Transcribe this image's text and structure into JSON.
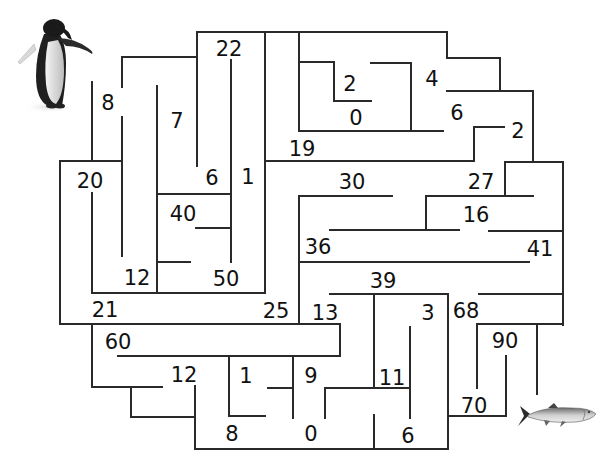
{
  "puzzle": {
    "type": "number-maze",
    "start": {
      "label": "penguin",
      "x": 55,
      "y": 65
    },
    "finish": {
      "label": "salmon fish",
      "x": 555,
      "y": 415
    },
    "numbers": [
      {
        "value": "22",
        "x": 229,
        "y": 49
      },
      {
        "value": "8",
        "x": 108,
        "y": 103
      },
      {
        "value": "7",
        "x": 177,
        "y": 121
      },
      {
        "value": "2",
        "x": 350,
        "y": 84
      },
      {
        "value": "4",
        "x": 432,
        "y": 79
      },
      {
        "value": "0",
        "x": 356,
        "y": 118
      },
      {
        "value": "6",
        "x": 457,
        "y": 113
      },
      {
        "value": "2",
        "x": 518,
        "y": 131
      },
      {
        "value": "19",
        "x": 302,
        "y": 149
      },
      {
        "value": "20",
        "x": 90,
        "y": 181
      },
      {
        "value": "6",
        "x": 212,
        "y": 178
      },
      {
        "value": "1",
        "x": 248,
        "y": 177
      },
      {
        "value": "30",
        "x": 352,
        "y": 182
      },
      {
        "value": "27",
        "x": 481,
        "y": 182
      },
      {
        "value": "40",
        "x": 183,
        "y": 214
      },
      {
        "value": "16",
        "x": 476,
        "y": 215
      },
      {
        "value": "36",
        "x": 318,
        "y": 247
      },
      {
        "value": "41",
        "x": 540,
        "y": 249
      },
      {
        "value": "12",
        "x": 137,
        "y": 278
      },
      {
        "value": "50",
        "x": 226,
        "y": 279
      },
      {
        "value": "39",
        "x": 383,
        "y": 281
      },
      {
        "value": "21",
        "x": 105,
        "y": 310
      },
      {
        "value": "25",
        "x": 276,
        "y": 311
      },
      {
        "value": "13",
        "x": 325,
        "y": 313
      },
      {
        "value": "3",
        "x": 428,
        "y": 313
      },
      {
        "value": "68",
        "x": 466,
        "y": 311
      },
      {
        "value": "60",
        "x": 118,
        "y": 342
      },
      {
        "value": "90",
        "x": 505,
        "y": 341
      },
      {
        "value": "12",
        "x": 184,
        "y": 375
      },
      {
        "value": "1",
        "x": 246,
        "y": 376
      },
      {
        "value": "9",
        "x": 311,
        "y": 376
      },
      {
        "value": "11",
        "x": 392,
        "y": 378
      },
      {
        "value": "70",
        "x": 474,
        "y": 406
      },
      {
        "value": "8",
        "x": 232,
        "y": 434
      },
      {
        "value": "0",
        "x": 311,
        "y": 434
      },
      {
        "value": "6",
        "x": 408,
        "y": 436
      }
    ],
    "walls": [
      [
        197,
        32,
        447,
        32
      ],
      [
        197,
        32,
        197,
        166
      ],
      [
        122,
        57,
        197,
        57
      ],
      [
        122,
        57,
        122,
        87
      ],
      [
        122,
        117,
        122,
        256
      ],
      [
        92,
        82,
        92,
        161
      ],
      [
        157,
        86,
        157,
        292
      ],
      [
        265,
        32,
        265,
        293
      ],
      [
        231,
        60,
        231,
        262
      ],
      [
        299,
        32,
        299,
        131
      ],
      [
        299,
        62,
        334,
        62
      ],
      [
        334,
        62,
        334,
        101
      ],
      [
        334,
        101,
        371,
        101
      ],
      [
        371,
        63,
        411,
        63
      ],
      [
        411,
        63,
        411,
        131
      ],
      [
        299,
        131,
        443,
        131
      ],
      [
        447,
        32,
        447,
        58
      ],
      [
        447,
        58,
        500,
        58
      ],
      [
        500,
        58,
        500,
        91
      ],
      [
        447,
        91,
        533,
        91
      ],
      [
        533,
        91,
        533,
        162
      ],
      [
        474,
        127,
        504,
        127
      ],
      [
        474,
        127,
        474,
        161
      ],
      [
        265,
        161,
        474,
        161
      ],
      [
        505,
        162,
        563,
        162
      ],
      [
        505,
        162,
        505,
        196
      ],
      [
        563,
        162,
        563,
        325
      ],
      [
        426,
        196,
        533,
        196
      ],
      [
        426,
        196,
        426,
        230
      ],
      [
        330,
        230,
        459,
        230
      ],
      [
        489,
        231,
        563,
        231
      ],
      [
        60,
        161,
        122,
        161
      ],
      [
        60,
        161,
        60,
        324
      ],
      [
        92,
        193,
        92,
        293
      ],
      [
        92,
        293,
        265,
        293
      ],
      [
        157,
        194,
        231,
        194
      ],
      [
        196,
        228,
        231,
        228
      ],
      [
        157,
        262,
        190,
        262
      ],
      [
        299,
        196,
        392,
        196
      ],
      [
        299,
        196,
        299,
        324
      ],
      [
        299,
        262,
        529,
        262
      ],
      [
        330,
        294,
        448,
        294
      ],
      [
        374,
        294,
        374,
        388
      ],
      [
        448,
        294,
        448,
        449
      ],
      [
        479,
        294,
        563,
        294
      ],
      [
        477,
        324,
        563,
        324
      ],
      [
        477,
        324,
        477,
        388
      ],
      [
        537,
        324,
        537,
        394
      ],
      [
        60,
        324,
        340,
        324
      ],
      [
        92,
        324,
        92,
        387
      ],
      [
        340,
        324,
        340,
        356
      ],
      [
        118,
        356,
        340,
        356
      ],
      [
        229,
        356,
        229,
        416
      ],
      [
        293,
        356,
        293,
        418
      ],
      [
        92,
        387,
        162,
        387
      ],
      [
        131,
        387,
        131,
        417
      ],
      [
        131,
        417,
        195,
        417
      ],
      [
        195,
        386,
        195,
        449
      ],
      [
        229,
        416,
        265,
        416
      ],
      [
        268,
        388,
        293,
        388
      ],
      [
        325,
        388,
        410,
        388
      ],
      [
        325,
        388,
        325,
        418
      ],
      [
        410,
        327,
        410,
        418
      ],
      [
        374,
        415,
        374,
        449
      ],
      [
        195,
        449,
        448,
        449
      ],
      [
        448,
        416,
        506,
        416
      ],
      [
        506,
        356,
        506,
        416
      ]
    ]
  },
  "colors": {
    "wall": "#2a2a2a",
    "text": "#111111",
    "background": "#ffffff"
  }
}
